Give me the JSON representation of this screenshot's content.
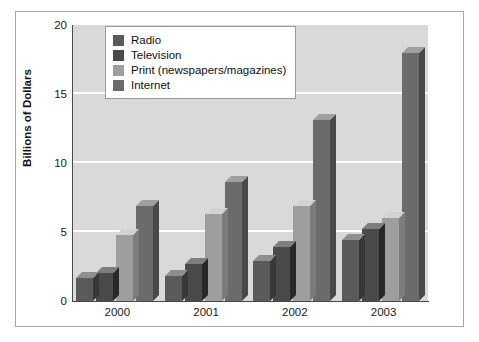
{
  "chart_data": {
    "type": "bar",
    "title": "",
    "xlabel": "",
    "ylabel": "Billions of Dollars",
    "categories": [
      "2000",
      "2001",
      "2002",
      "2003"
    ],
    "ylim": [
      0,
      20
    ],
    "yticks": [
      "0",
      "5",
      "10",
      "15",
      "20"
    ],
    "ytick_values": [
      0,
      5,
      10,
      15,
      20
    ],
    "grid": "horizontal",
    "legend_position": "top-center",
    "series": [
      {
        "name": "Radio",
        "color": "#5a5a5a",
        "values": [
          1.7,
          1.8,
          2.9,
          4.4
        ]
      },
      {
        "name": "Television",
        "color": "#4a4a4a",
        "values": [
          2.0,
          2.7,
          3.9,
          5.2
        ]
      },
      {
        "name": "Print (newspapers/magazines)",
        "color": "#9e9e9e",
        "values": [
          4.8,
          6.3,
          6.9,
          6.0
        ]
      },
      {
        "name": "Internet",
        "color": "#6b6b6b",
        "values": [
          6.9,
          8.6,
          13.1,
          18.0
        ]
      }
    ]
  },
  "style": {
    "plot_background": "#d9d9d9",
    "gridline_color": "#ffffff",
    "axis_color": "#4a4a4a",
    "frame_color": "#a8a8a8",
    "page_background": "#ffffff"
  }
}
